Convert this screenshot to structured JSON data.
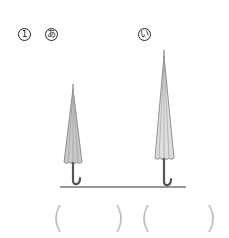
{
  "problem": {
    "number": "1",
    "items": [
      {
        "id": "a",
        "label": "あ",
        "description": "short umbrella"
      },
      {
        "id": "b",
        "label": "い",
        "description": "tall umbrella"
      }
    ]
  },
  "answers": [
    {
      "open": "(",
      "close": ")",
      "value": ""
    },
    {
      "open": "(",
      "close": ")",
      "value": ""
    }
  ],
  "colors": {
    "canopy_fill": "#c8c8c8",
    "canopy_stroke": "#777777",
    "handle": "#555555",
    "ground": "#333333",
    "paren": "#b5b5b5"
  }
}
